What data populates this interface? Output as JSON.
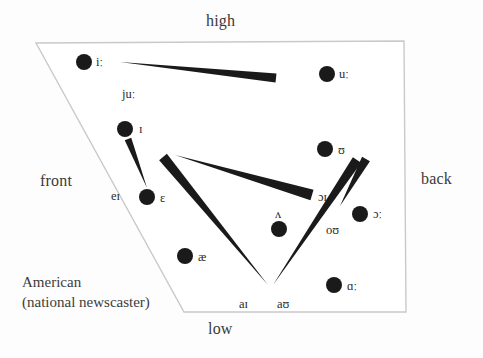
{
  "figure": {
    "caption_line1": "American",
    "caption_line2": "(national newscaster)"
  },
  "axes": {
    "high": "high",
    "low": "low",
    "front": "front",
    "back": "back"
  },
  "colors": {
    "dot": "#1a1a1a",
    "outline": "#c9c9c9",
    "text": "#2b2b2b",
    "background": "#fdfdfd"
  },
  "chart_data": {
    "type": "scatter",
    "title": "American (national newscaster)",
    "xlabel": "front – back",
    "ylabel": "high – low",
    "grid": false,
    "legend": false,
    "quadrilateral": [
      [
        36,
        43
      ],
      [
        404,
        41
      ],
      [
        406,
        312
      ],
      [
        184,
        312
      ]
    ],
    "monophthongs": [
      {
        "symbol": "iː",
        "cx": 84,
        "cy": 62,
        "label_dx": 12,
        "label_dy": -7
      },
      {
        "symbol": "uː",
        "cx": 327,
        "cy": 74,
        "label_dx": 12,
        "label_dy": -7
      },
      {
        "symbol": "ɪ",
        "cx": 125,
        "cy": 129,
        "label_dx": 14,
        "label_dy": -7
      },
      {
        "symbol": "ʊ",
        "cx": 325,
        "cy": 149,
        "label_dx": 13,
        "label_dy": -6
      },
      {
        "symbol": "ɛ",
        "cx": 147,
        "cy": 197,
        "label_dx": 13,
        "label_dy": -6
      },
      {
        "symbol": "ʌ",
        "cx": 279,
        "cy": 229,
        "label_dx": -4,
        "label_dy": -22
      },
      {
        "symbol": "ɔː",
        "cx": 360,
        "cy": 214,
        "label_dx": 13,
        "label_dy": -7
      },
      {
        "symbol": "æ",
        "cx": 185,
        "cy": 256,
        "label_dx": 13,
        "label_dy": -6
      },
      {
        "symbol": "ɑː",
        "cx": 334,
        "cy": 285,
        "label_dx": 13,
        "label_dy": -6
      }
    ],
    "diphthongs": [
      {
        "symbol": "juː",
        "label_x": 122,
        "label_y": 87,
        "from": [
          120,
          62
        ],
        "to": [
          276,
          78
        ],
        "width": 9
      },
      {
        "symbol": "eɪ",
        "label_x": 111,
        "label_y": 189,
        "from": [
          147,
          188
        ],
        "to": [
          128,
          139
        ],
        "width": 7
      },
      {
        "symbol": "ɔɪ",
        "label_x": 318,
        "label_y": 190,
        "from": [
          175,
          155
        ],
        "to": [
          312,
          195
        ],
        "width": 11
      },
      {
        "symbol": "oʊ",
        "label_x": 326,
        "label_y": 223,
        "from": [
          340,
          206
        ],
        "to": [
          366,
          159
        ],
        "width": 9
      },
      {
        "symbol": "aɪ",
        "label_x": 239,
        "label_y": 297,
        "from": [
          268,
          285
        ],
        "to": [
          163,
          157
        ],
        "width": 10
      },
      {
        "symbol": "aʊ",
        "label_x": 277,
        "label_y": 297,
        "from": [
          273,
          285
        ],
        "to": [
          357,
          160
        ],
        "width": 10
      }
    ]
  }
}
